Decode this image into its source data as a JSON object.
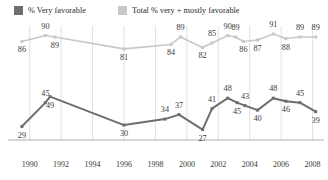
{
  "legend": {
    "items": [
      {
        "label": "% Very favorable",
        "color": "#6e6e6e"
      },
      {
        "label": "Total % very + mostly favorable",
        "color": "#c8c8c8"
      }
    ]
  },
  "axis": {
    "ticks": [
      "1990",
      "1992",
      "1994",
      "1996",
      "1998",
      "2000",
      "2002",
      "2004",
      "2006",
      "2008"
    ]
  },
  "colors": {
    "very_favorable": "#6e6e6e",
    "total_favorable": "#c8c8c8",
    "gridline": "#d9d9d9",
    "axisline": "#a6a6a6",
    "text": "#3a3a3a"
  },
  "chart_data": {
    "type": "line",
    "title": "",
    "subtitle": "",
    "xlabel": "",
    "ylabel": "",
    "xlim": [
      1989,
      2008.6
    ],
    "ylim": [
      20,
      95
    ],
    "grid": "vertical-only",
    "legend_position": "top-left",
    "xticks": [
      1990,
      1992,
      1994,
      1996,
      1998,
      2000,
      2002,
      2004,
      2006,
      2008
    ],
    "series": [
      {
        "name": "Total % very + mostly favorable",
        "color": "#c8c8c8",
        "points": [
          {
            "x": 1989.5,
            "y": 86,
            "label": "86",
            "label_pos": "below"
          },
          {
            "x": 1991.0,
            "y": 90,
            "label": "90",
            "label_pos": "above"
          },
          {
            "x": 1991.6,
            "y": 89,
            "label": "89",
            "label_pos": "below"
          },
          {
            "x": 1996.0,
            "y": 81,
            "label": "81",
            "label_pos": "below"
          },
          {
            "x": 1999.0,
            "y": 84,
            "label": "84",
            "label_pos": "below"
          },
          {
            "x": 1999.6,
            "y": 89,
            "label": "89",
            "label_pos": "above"
          },
          {
            "x": 2001.0,
            "y": 82,
            "label": "82",
            "label_pos": "below"
          },
          {
            "x": 2001.6,
            "y": 85,
            "label": "85",
            "label_pos": "above"
          },
          {
            "x": 2002.6,
            "y": 90,
            "label": "90",
            "label_pos": "above"
          },
          {
            "x": 2003.1,
            "y": 89,
            "label": "89",
            "label_pos": "above"
          },
          {
            "x": 2003.6,
            "y": 86,
            "label": "86",
            "label_pos": "below"
          },
          {
            "x": 2004.5,
            "y": 87,
            "label": "87",
            "label_pos": "below"
          },
          {
            "x": 2005.5,
            "y": 91,
            "label": "91",
            "label_pos": "above"
          },
          {
            "x": 2006.3,
            "y": 88,
            "label": "88",
            "label_pos": "below"
          },
          {
            "x": 2007.2,
            "y": 89,
            "label": "89",
            "label_pos": "above"
          },
          {
            "x": 2008.2,
            "y": 89,
            "label": "89",
            "label_pos": "above"
          }
        ]
      },
      {
        "name": "% Very favorable",
        "color": "#6e6e6e",
        "points": [
          {
            "x": 1989.5,
            "y": 29,
            "label": "29",
            "label_pos": "below"
          },
          {
            "x": 1991.0,
            "y": 45,
            "label": "45",
            "label_pos": "above"
          },
          {
            "x": 1991.3,
            "y": 49,
            "label": "49",
            "label_pos": "below"
          },
          {
            "x": 1996.0,
            "y": 30,
            "label": "30",
            "label_pos": "below"
          },
          {
            "x": 1998.6,
            "y": 34,
            "label": "34",
            "label_pos": "above"
          },
          {
            "x": 1999.5,
            "y": 37,
            "label": "37",
            "label_pos": "above"
          },
          {
            "x": 2001.0,
            "y": 27,
            "label": "27",
            "label_pos": "below"
          },
          {
            "x": 2001.6,
            "y": 41,
            "label": "41",
            "label_pos": "above"
          },
          {
            "x": 2002.6,
            "y": 48,
            "label": "48",
            "label_pos": "above"
          },
          {
            "x": 2003.2,
            "y": 45,
            "label": "45",
            "label_pos": "below"
          },
          {
            "x": 2003.7,
            "y": 43,
            "label": "43",
            "label_pos": "above"
          },
          {
            "x": 2004.5,
            "y": 40,
            "label": "40",
            "label_pos": "below"
          },
          {
            "x": 2005.5,
            "y": 48,
            "label": "48",
            "label_pos": "above"
          },
          {
            "x": 2006.3,
            "y": 46,
            "label": "46",
            "label_pos": "below"
          },
          {
            "x": 2007.2,
            "y": 45,
            "label": "45",
            "label_pos": "above"
          },
          {
            "x": 2008.2,
            "y": 39,
            "label": "39",
            "label_pos": "below"
          }
        ]
      }
    ]
  }
}
